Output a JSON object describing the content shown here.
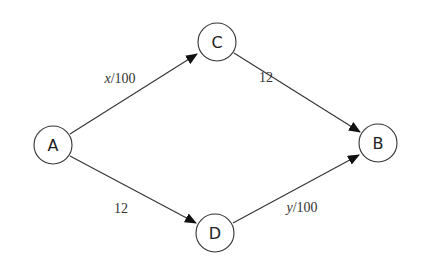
{
  "diagram": {
    "type": "directed-network",
    "nodes": [
      {
        "id": "A",
        "label": "A",
        "x": 53,
        "y": 145
      },
      {
        "id": "C",
        "label": "C",
        "x": 217,
        "y": 42
      },
      {
        "id": "B",
        "label": "B",
        "x": 378,
        "y": 143
      },
      {
        "id": "D",
        "label": "D",
        "x": 215,
        "y": 233
      }
    ],
    "edges": [
      {
        "from": "A",
        "to": "C",
        "label_var": "x",
        "label_rest": "/100",
        "label_x": 120,
        "label_y": 78
      },
      {
        "from": "C",
        "to": "B",
        "label_var": "",
        "label_rest": "12",
        "label_x": 266,
        "label_y": 77
      },
      {
        "from": "A",
        "to": "D",
        "label_var": "",
        "label_rest": "12",
        "label_x": 121,
        "label_y": 208
      },
      {
        "from": "D",
        "to": "B",
        "label_var": "y",
        "label_rest": "/100",
        "label_x": 302,
        "label_y": 207
      }
    ],
    "colors": {
      "stroke": "#333333",
      "background": "#ffffff"
    }
  }
}
